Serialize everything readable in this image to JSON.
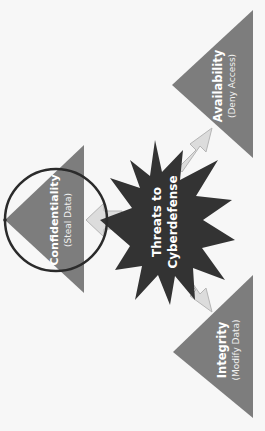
{
  "diagram": {
    "center": {
      "line1": "Threats to",
      "line2": "Cyberdefense",
      "shape": "starburst",
      "color": "#333333"
    },
    "nodes": [
      {
        "id": "confidentiality",
        "title": "Confidentiality",
        "subtitle": "(Steal Data)",
        "highlighted": true
      },
      {
        "id": "availability",
        "title": "Availability",
        "subtitle": "(Deny Access)",
        "highlighted": false
      },
      {
        "id": "integrity",
        "title": "Integrity",
        "subtitle": "(Modify Data)",
        "highlighted": false
      }
    ],
    "colors": {
      "triangle": "#7d7d7d",
      "arrow_fill": "#dcdcdc",
      "arrow_stroke": "#b5b5b5",
      "highlight_circle": "#2b2b2b",
      "background": "#f7f7f7"
    }
  }
}
